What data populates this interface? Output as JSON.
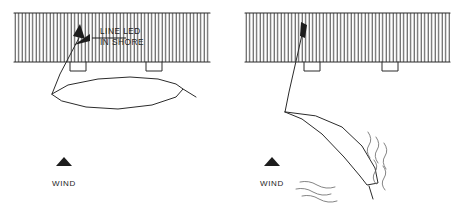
{
  "figure": {
    "background_color": "#ffffff",
    "line_color": "#2b2b2b",
    "hatch_color": "#4a4a4a",
    "wave_color": "#6e6e6e"
  },
  "panels": [
    {
      "id": "left",
      "name": "boat-alongside-dock",
      "dock": {
        "x": 14,
        "y": 13,
        "width": 196,
        "height": 49,
        "hatch_spacing": 3.5,
        "pilings": [
          {
            "x": 70,
            "y": 62,
            "width": 16,
            "height": 9
          },
          {
            "x": 146,
            "y": 62,
            "width": 16,
            "height": 9
          }
        ]
      },
      "annotation": {
        "line1": "LINE LED",
        "line2": "IN SHORE",
        "text_x": 98,
        "text_y1": 32,
        "text_y2": 42
      },
      "wind": {
        "label": "WIND",
        "x": 64,
        "y": 163,
        "label_y": 186,
        "direction": "up"
      }
    },
    {
      "id": "right",
      "name": "boat-blown-off-dock",
      "dock": {
        "x": 245,
        "y": 13,
        "width": 205,
        "height": 49,
        "hatch_spacing": 3.5,
        "pilings": [
          {
            "x": 304,
            "y": 62,
            "width": 16,
            "height": 9
          },
          {
            "x": 382,
            "y": 62,
            "width": 16,
            "height": 9
          }
        ]
      },
      "wind": {
        "label": "WIND",
        "x": 272,
        "y": 163,
        "label_y": 186,
        "direction": "up"
      }
    }
  ],
  "geometry": {
    "left_hull_path": "M 52 94 L 68 85 L 98 79 L 130 77 L 158 79 L 176 84 L 183 89 L 176 97 L 152 105 L 118 109 L 86 107 L 62 101 Z",
    "left_mooring_path": "M 52 94 L 60 74 L 70 55 L 79 38",
    "left_tiller_path": "M 183 89 L 196 97",
    "left_leader_path": "M 126 38 L 92 38 L 76 44",
    "right_hull_path": "M 285 112 L 302 119 L 322 134 L 344 157 L 360 176 L 367 185 L 378 183 L 375 168 L 362 146 L 342 127 L 316 116 Z",
    "right_mooring_path": "M 285 112 L 289 92 L 294 70 L 299 48 L 303 30",
    "right_tiller_path": "M 369 186 L 373 199",
    "waves_right": [
      "M 368 132 q 5 7 1 13 q -4 6 1 13",
      "M 376 137 q 5 7 1 13 q -4 6 1 13",
      "M 384 143 q 5 7 1 13 q -4 6 1 13",
      "M 374 160 q 5 6 1 12 q -4 6 1 12",
      "M 383 166 q 5 6 1 12 q -4 6 1 12"
    ],
    "waves_lower": [
      "M 300 182 q 9 -2 17 3 q 9 5 18 2",
      "M 296 189 q 9 -2 17 3 q 9 5 18 2",
      "M 302 196 q 9 -2 17 3 q 9 5 18 2"
    ]
  }
}
